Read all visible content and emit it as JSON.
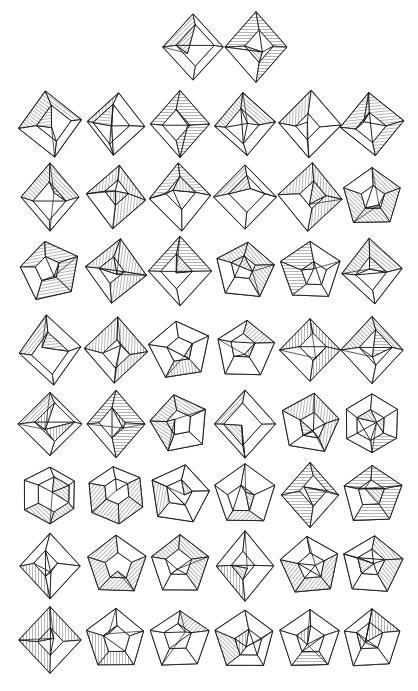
{
  "document": {
    "kind": "figure-plate",
    "title": "Catalog of polyhedral crease patterns",
    "background_color": "#ffffff",
    "ink_color": "#1a1a1a",
    "width_px": 418,
    "height_px": 691,
    "line_weight_px": 1,
    "shading_style": "line-hatching"
  },
  "layout": {
    "type": "grid",
    "total_figures": 56,
    "header_row": {
      "count": 2,
      "center_y": 47,
      "x_positions": [
        193,
        256
      ]
    },
    "body": {
      "columns": 6,
      "rows": 9,
      "column_x": [
        50,
        116,
        180,
        245,
        310,
        372
      ],
      "row_y": [
        124,
        197,
        271,
        350,
        424,
        495,
        566,
        640
      ],
      "cell_width": 64,
      "cell_height": 72
    }
  },
  "palette": {
    "paper": "#ffffff",
    "stroke": "#1a1a1a",
    "hatch": "#2b2b2b"
  },
  "hatch_patterns": [
    {
      "id": "hatchDiag",
      "name": "diagonal-hatch",
      "angle_deg": 45,
      "spacing_px": 3
    },
    {
      "id": "hatchAnti",
      "name": "anti-diagonal-hatch",
      "angle_deg": -45,
      "spacing_px": 3
    },
    {
      "id": "hatchHoriz",
      "name": "horizontal-hatch",
      "angle_deg": 0,
      "spacing_px": 3
    },
    {
      "id": "hatchVert",
      "name": "vertical-hatch",
      "angle_deg": 90,
      "spacing_px": 3
    }
  ],
  "figures": [
    {
      "index": 1,
      "row": 0,
      "col": 0,
      "silhouette": "diamond",
      "cx": 193,
      "cy": 47,
      "rot": 0,
      "variant": "a"
    },
    {
      "index": 2,
      "row": 0,
      "col": 1,
      "silhouette": "diamond",
      "cx": 256,
      "cy": 47,
      "rot": 0,
      "variant": "b"
    },
    {
      "index": 3,
      "row": 1,
      "col": 0,
      "silhouette": "diamond",
      "cx": 50,
      "cy": 124,
      "rot": -8,
      "variant": "c"
    },
    {
      "index": 4,
      "row": 1,
      "col": 1,
      "silhouette": "diamond",
      "cx": 116,
      "cy": 124,
      "rot": 5,
      "variant": "a"
    },
    {
      "index": 5,
      "row": 1,
      "col": 2,
      "silhouette": "diamond",
      "cx": 180,
      "cy": 124,
      "rot": 0,
      "variant": "b"
    },
    {
      "index": 6,
      "row": 1,
      "col": 3,
      "silhouette": "diamond",
      "cx": 245,
      "cy": 124,
      "rot": -4,
      "variant": "d"
    },
    {
      "index": 7,
      "row": 1,
      "col": 4,
      "silhouette": "diamond",
      "cx": 310,
      "cy": 124,
      "rot": 2,
      "variant": "c"
    },
    {
      "index": 8,
      "row": 1,
      "col": 5,
      "silhouette": "diamond",
      "cx": 372,
      "cy": 124,
      "rot": -6,
      "variant": "e"
    },
    {
      "index": 9,
      "row": 2,
      "col": 0,
      "silhouette": "diamond",
      "cx": 50,
      "cy": 197,
      "rot": 0,
      "variant": "f"
    },
    {
      "index": 10,
      "row": 2,
      "col": 1,
      "silhouette": "diamond",
      "cx": 116,
      "cy": 197,
      "rot": 6,
      "variant": "a"
    },
    {
      "index": 11,
      "row": 2,
      "col": 2,
      "silhouette": "diamond",
      "cx": 180,
      "cy": 197,
      "rot": -3,
      "variant": "c"
    },
    {
      "index": 12,
      "row": 2,
      "col": 3,
      "silhouette": "diamond",
      "cx": 245,
      "cy": 197,
      "rot": 0,
      "variant": "d"
    },
    {
      "index": 13,
      "row": 2,
      "col": 4,
      "silhouette": "diamond",
      "cx": 310,
      "cy": 197,
      "rot": 4,
      "variant": "b"
    },
    {
      "index": 14,
      "row": 2,
      "col": 5,
      "silhouette": "pentagon",
      "cx": 372,
      "cy": 197,
      "rot": 0,
      "variant": "a"
    },
    {
      "index": 15,
      "row": 3,
      "col": 0,
      "silhouette": "pentagon",
      "cx": 50,
      "cy": 271,
      "rot": -10,
      "variant": "b"
    },
    {
      "index": 16,
      "row": 3,
      "col": 1,
      "silhouette": "diamond",
      "cx": 116,
      "cy": 271,
      "rot": 8,
      "variant": "e"
    },
    {
      "index": 17,
      "row": 3,
      "col": 2,
      "silhouette": "diamond",
      "cx": 180,
      "cy": 271,
      "rot": 0,
      "variant": "a"
    },
    {
      "index": 18,
      "row": 3,
      "col": 3,
      "silhouette": "pentagon",
      "cx": 245,
      "cy": 271,
      "rot": 6,
      "variant": "c"
    },
    {
      "index": 19,
      "row": 3,
      "col": 4,
      "silhouette": "pentagon",
      "cx": 310,
      "cy": 271,
      "rot": 0,
      "variant": "d"
    },
    {
      "index": 20,
      "row": 3,
      "col": 5,
      "silhouette": "diamond",
      "cx": 372,
      "cy": 271,
      "rot": -5,
      "variant": "f"
    },
    {
      "index": 21,
      "row": 4,
      "col": 0,
      "silhouette": "diamond",
      "cx": 50,
      "cy": 350,
      "rot": -6,
      "variant": "c"
    },
    {
      "index": 22,
      "row": 4,
      "col": 1,
      "silhouette": "diamond",
      "cx": 116,
      "cy": 350,
      "rot": 3,
      "variant": "a"
    },
    {
      "index": 23,
      "row": 4,
      "col": 2,
      "silhouette": "pentagon",
      "cx": 180,
      "cy": 350,
      "rot": -8,
      "variant": "e"
    },
    {
      "index": 24,
      "row": 4,
      "col": 3,
      "silhouette": "pentagon",
      "cx": 245,
      "cy": 350,
      "rot": 4,
      "variant": "b"
    },
    {
      "index": 25,
      "row": 4,
      "col": 4,
      "silhouette": "diamond",
      "cx": 310,
      "cy": 350,
      "rot": 0,
      "variant": "g"
    },
    {
      "index": 26,
      "row": 4,
      "col": 5,
      "silhouette": "diamond",
      "cx": 372,
      "cy": 350,
      "rot": 0,
      "variant": "f"
    },
    {
      "index": 27,
      "row": 5,
      "col": 0,
      "silhouette": "diamond",
      "cx": 50,
      "cy": 424,
      "rot": 0,
      "variant": "h"
    },
    {
      "index": 28,
      "row": 5,
      "col": 1,
      "silhouette": "diamond",
      "cx": 116,
      "cy": 424,
      "rot": 0,
      "variant": "i"
    },
    {
      "index": 29,
      "row": 5,
      "col": 2,
      "silhouette": "pentagon",
      "cx": 180,
      "cy": 424,
      "rot": -12,
      "variant": "f"
    },
    {
      "index": 30,
      "row": 5,
      "col": 3,
      "silhouette": "diamond",
      "cx": 245,
      "cy": 424,
      "rot": 0,
      "variant": "g"
    },
    {
      "index": 31,
      "row": 5,
      "col": 4,
      "silhouette": "pentagon",
      "cx": 310,
      "cy": 424,
      "rot": 8,
      "variant": "g"
    },
    {
      "index": 32,
      "row": 5,
      "col": 5,
      "silhouette": "hexagon",
      "cx": 372,
      "cy": 424,
      "rot": 0,
      "variant": "a"
    },
    {
      "index": 33,
      "row": 6,
      "col": 0,
      "silhouette": "hexagon",
      "cx": 50,
      "cy": 495,
      "rot": 0,
      "variant": "b"
    },
    {
      "index": 34,
      "row": 6,
      "col": 1,
      "silhouette": "hexagon",
      "cx": 116,
      "cy": 495,
      "rot": -6,
      "variant": "c"
    },
    {
      "index": 35,
      "row": 6,
      "col": 2,
      "silhouette": "pentagon",
      "cx": 180,
      "cy": 495,
      "rot": 10,
      "variant": "h"
    },
    {
      "index": 36,
      "row": 6,
      "col": 3,
      "silhouette": "pentagon",
      "cx": 245,
      "cy": 495,
      "rot": 0,
      "variant": "i"
    },
    {
      "index": 37,
      "row": 6,
      "col": 4,
      "silhouette": "diamond",
      "cx": 310,
      "cy": 495,
      "rot": 0,
      "variant": "j"
    },
    {
      "index": 38,
      "row": 6,
      "col": 5,
      "silhouette": "pentagon",
      "cx": 372,
      "cy": 495,
      "rot": 0,
      "variant": "j"
    },
    {
      "index": 39,
      "row": 7,
      "col": 0,
      "silhouette": "diamond",
      "cx": 50,
      "cy": 566,
      "rot": 0,
      "variant": "k"
    },
    {
      "index": 40,
      "row": 7,
      "col": 1,
      "silhouette": "pentagon",
      "cx": 116,
      "cy": 566,
      "rot": 0,
      "variant": "c"
    },
    {
      "index": 41,
      "row": 7,
      "col": 2,
      "silhouette": "pentagon",
      "cx": 180,
      "cy": 566,
      "rot": 0,
      "variant": "d"
    },
    {
      "index": 42,
      "row": 7,
      "col": 3,
      "silhouette": "diamond",
      "cx": 245,
      "cy": 566,
      "rot": 0,
      "variant": "k"
    },
    {
      "index": 43,
      "row": 7,
      "col": 4,
      "silhouette": "pentagon",
      "cx": 310,
      "cy": 566,
      "rot": -6,
      "variant": "k"
    },
    {
      "index": 44,
      "row": 7,
      "col": 5,
      "silhouette": "pentagon",
      "cx": 372,
      "cy": 566,
      "rot": 5,
      "variant": "l"
    },
    {
      "index": 45,
      "row": 8,
      "col": 0,
      "silhouette": "diamond",
      "cx": 50,
      "cy": 640,
      "rot": 0,
      "variant": "l"
    },
    {
      "index": 46,
      "row": 8,
      "col": 1,
      "silhouette": "pentagon",
      "cx": 116,
      "cy": 640,
      "rot": 0,
      "variant": "m"
    },
    {
      "index": 47,
      "row": 8,
      "col": 2,
      "silhouette": "pentagon",
      "cx": 180,
      "cy": 640,
      "rot": 0,
      "variant": "n"
    },
    {
      "index": 48,
      "row": 8,
      "col": 3,
      "silhouette": "pentagon",
      "cx": 245,
      "cy": 640,
      "rot": 0,
      "variant": "o"
    },
    {
      "index": 49,
      "row": 8,
      "col": 4,
      "silhouette": "pentagon",
      "cx": 310,
      "cy": 640,
      "rot": 0,
      "variant": "p"
    },
    {
      "index": 50,
      "row": 8,
      "col": 5,
      "silhouette": "pentagon",
      "cx": 372,
      "cy": 640,
      "rot": 0,
      "variant": "q"
    }
  ]
}
